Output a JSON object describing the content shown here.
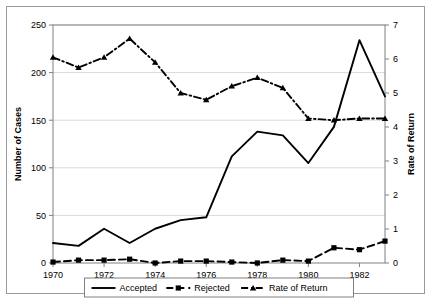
{
  "chart_data": {
    "type": "line",
    "title": "",
    "xlabel": "",
    "x": [
      1970,
      1971,
      1972,
      1973,
      1974,
      1975,
      1976,
      1977,
      1978,
      1979,
      1980,
      1981,
      1982,
      1983
    ],
    "x_tick_labels": [
      "1970",
      "1972",
      "1974",
      "1976",
      "1978",
      "1980",
      "1982"
    ],
    "x_tick_values": [
      1970,
      1972,
      1974,
      1976,
      1978,
      1980,
      1982
    ],
    "xlim": [
      1970,
      1983
    ],
    "grid": true,
    "legend_position": "bottom",
    "axes": [
      {
        "id": "left",
        "label": "Number of Cases",
        "ylim": [
          0,
          250
        ],
        "ticks": [
          0,
          50,
          100,
          150,
          200,
          250
        ],
        "tick_labels": [
          "0",
          "50",
          "100",
          "150",
          "200",
          "250"
        ]
      },
      {
        "id": "right",
        "label": "Rate of Return",
        "ylim": [
          0,
          7
        ],
        "ticks": [
          0,
          1,
          2,
          3,
          4,
          5,
          6,
          7
        ],
        "tick_labels": [
          "0",
          "1",
          "2",
          "3",
          "4",
          "5",
          "6",
          "7"
        ]
      }
    ],
    "series": [
      {
        "name": "Accepted",
        "axis": "left",
        "marker": "none",
        "line_style": "solid",
        "color": "#000000",
        "values": [
          21,
          18,
          36,
          21,
          36,
          45,
          48,
          112,
          138,
          134,
          105,
          143,
          234,
          175
        ]
      },
      {
        "name": "Rejected",
        "axis": "left",
        "marker": "square",
        "line_style": "dashed",
        "color": "#000000",
        "values": [
          1,
          3,
          3,
          4,
          0,
          2,
          2,
          1,
          0,
          3,
          2,
          16,
          14,
          23
        ]
      },
      {
        "name": "Rate of Return",
        "axis": "right",
        "marker": "triangle",
        "line_style": "dashdot",
        "color": "#000000",
        "values": [
          6.05,
          5.75,
          6.05,
          6.6,
          5.9,
          5.0,
          4.8,
          5.2,
          5.45,
          5.15,
          4.25,
          4.2,
          4.25,
          4.25
        ]
      }
    ]
  },
  "legend": {
    "entries": [
      {
        "label": "Accepted"
      },
      {
        "label": "Rejected"
      },
      {
        "label": "Rate of Return"
      }
    ]
  },
  "colors": {
    "plot_border": "#808080",
    "gridline": "#d9d9d9",
    "frame": "#9a9a9a",
    "ink": "#000000",
    "background": "#ffffff"
  }
}
